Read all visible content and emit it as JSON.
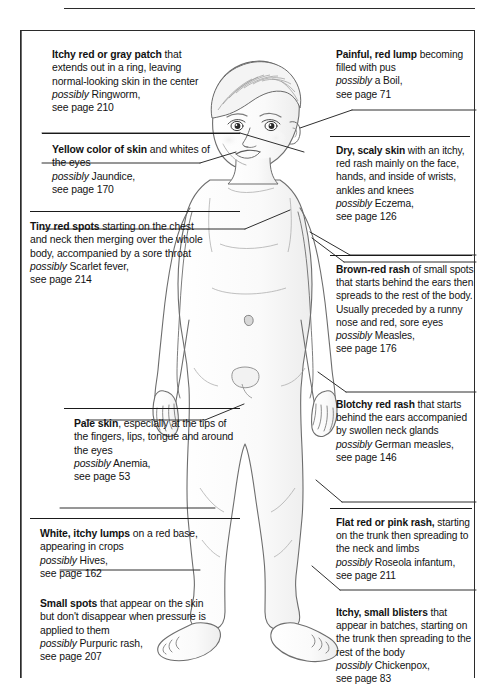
{
  "document": {
    "title": "Childhood skin rashes and spots — visual diagnosis guide",
    "figure_label": "toddler-body-illustration"
  },
  "left_column": [
    {
      "id": "ringworm",
      "bold": "Itchy red or gray patch",
      "body": " that extends out in a ring, leaving normal-looking skin in the center",
      "possibly_label": "possibly",
      "condition": " Ringworm,",
      "page_ref": "see page 210"
    },
    {
      "id": "jaundice",
      "bold": "Yellow color of skin",
      "body": " and whites of the eyes",
      "possibly_label": "possibly",
      "condition": " Jaundice,",
      "page_ref": "see page 170"
    },
    {
      "id": "scarlet-fever",
      "bold": "Tiny red spots",
      "body": " starting on the chest and neck then merging over the whole body, accompanied by a sore throat",
      "possibly_label": "possibly",
      "condition": " Scarlet fever,",
      "page_ref": "see page 214"
    },
    {
      "id": "anemia",
      "bold": "Pale skin",
      "body": ", especially at the tips of the fingers, lips, tongue and around the eyes",
      "possibly_label": "possibly",
      "condition": " Anemia,",
      "page_ref": "see page 53"
    },
    {
      "id": "hives",
      "bold": "White, itchy lumps",
      "body": " on a red base, appearing in crops",
      "possibly_label": "possibly",
      "condition": " Hives,",
      "page_ref": "see page 162"
    },
    {
      "id": "purpuric-rash",
      "bold": "Small spots",
      "body": " that appear on the skin but don't disappear when pressure is applied to them",
      "possibly_label": "possibly",
      "condition": " Purpuric rash,",
      "page_ref": "see page 207"
    }
  ],
  "right_column": [
    {
      "id": "boil",
      "bold": "Painful, red lump",
      "body": " becoming filled with pus",
      "possibly_label": "possibly",
      "condition": " a Boil,",
      "page_ref": "see page 71"
    },
    {
      "id": "eczema",
      "bold": "Dry, scaly skin",
      "body": " with an itchy, red rash mainly on the face, hands, and inside of wrists, ankles and knees",
      "possibly_label": "possibly",
      "condition": " Eczema,",
      "page_ref": "see page 126"
    },
    {
      "id": "measles",
      "bold": "Brown-red rash",
      "body": " of small spots that starts behind the ears then spreads to the rest of the body. Usually preceded by a runny nose and red, sore eyes",
      "possibly_label": "possibly",
      "condition": " Measles,",
      "page_ref": "see page 176"
    },
    {
      "id": "german-measles",
      "bold": "Blotchy red rash",
      "body": " that starts behind the ears accompanied by swollen neck glands",
      "possibly_label": "possibly",
      "condition": " German measles,",
      "page_ref": "see page 146"
    },
    {
      "id": "roseola",
      "bold": "Flat red or pink rash,",
      "body": " starting on the trunk then spreading to the neck and limbs",
      "possibly_label": "possibly",
      "condition": " Roseola infantum,",
      "page_ref": "see page 211"
    },
    {
      "id": "chickenpox",
      "bold": "Itchy, small blisters",
      "body": " that appear in batches, starting on the trunk then spreading to the rest of the body",
      "possibly_label": "possibly",
      "condition": " Chickenpox,",
      "page_ref": "see page 83"
    }
  ],
  "colors": {
    "text": "#121212",
    "rule": "#1a1a1a",
    "frame": "#2b2b2b",
    "leader": "#2f2f2f",
    "page_bg": "#ffffff",
    "skin_line": "#6d6d6d"
  }
}
